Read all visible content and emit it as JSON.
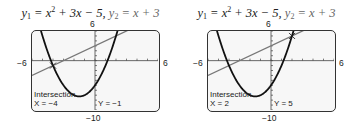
{
  "chart_data": [
    {
      "type": "line",
      "title": "y1 = x^2 + 3x - 5,  y2 = x + 3",
      "series": [
        {
          "name": "y1",
          "expression": "x^2 + 3x - 5"
        },
        {
          "name": "y2",
          "expression": "x + 3"
        }
      ],
      "xlim": [
        -6,
        6
      ],
      "ylim": [
        -10,
        6
      ],
      "axis_labels": {
        "xmin": "−6",
        "xmax": "6",
        "ymin": "−10",
        "ymax": "6"
      },
      "annotation": {
        "label": "Intersection",
        "x_text": "X = −4",
        "y_text": "Y = −1",
        "point": [
          -4,
          -1
        ]
      },
      "grid": false
    },
    {
      "type": "line",
      "title": "y1 = x^2 + 3x - 5,  y2 = x + 3",
      "series": [
        {
          "name": "y1",
          "expression": "x^2 + 3x - 5"
        },
        {
          "name": "y2",
          "expression": "x + 3"
        }
      ],
      "xlim": [
        -6,
        6
      ],
      "ylim": [
        -10,
        6
      ],
      "axis_labels": {
        "xmin": "−6",
        "xmax": "6",
        "ymin": "−10",
        "ymax": "6"
      },
      "annotation": {
        "label": "Intersection",
        "x_text": "X = 2",
        "y_text": "Y = 5",
        "point": [
          2,
          5
        ]
      },
      "grid": false
    }
  ],
  "panels": [
    {
      "title": {
        "y1": "y",
        "y1sub": "1",
        "eq1a": " = x",
        "sup": "2",
        "eq1b": " + 3x − 5,  ",
        "y2": "y",
        "y2sub": "2",
        "eq2": " = x + 3"
      },
      "xmin": "−6",
      "xmax": "6",
      "ymin": "−10",
      "ymax": "6",
      "calc": {
        "label": "Intersection",
        "x": "X = −4",
        "y": "Y = −1"
      }
    },
    {
      "title": {
        "y1": "y",
        "y1sub": "1",
        "eq1a": " = x",
        "sup": "2",
        "eq1b": " + 3x − 5,  ",
        "y2": "y",
        "y2sub": "2",
        "eq2": " = x + 3"
      },
      "xmin": "−6",
      "xmax": "6",
      "ymin": "−10",
      "ymax": "6",
      "calc": {
        "label": "Intersection",
        "x": "X = 2",
        "y": "Y = 5"
      }
    }
  ],
  "colors": {
    "parabola": "#111111",
    "line": "#777777",
    "screen": "#f7f7f7",
    "border": "#333333"
  }
}
